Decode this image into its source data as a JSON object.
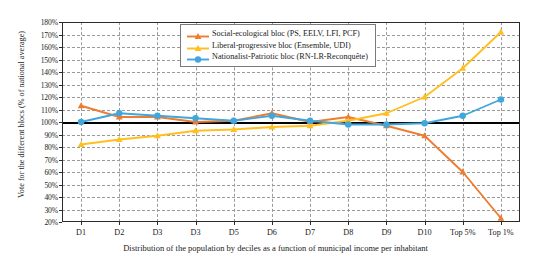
{
  "chart_data": {
    "type": "line",
    "title": "",
    "xlabel": "Distribution of the population by deciles as a function of municipal income per inhabitant",
    "ylabel": "Vote for the different blocs (% of national average)",
    "categories": [
      "D1",
      "D2",
      "D3",
      "D3",
      "D5",
      "D6",
      "D7",
      "D8",
      "D9",
      "D10",
      "Top 5%",
      "Top 1%"
    ],
    "ylim": [
      20,
      180
    ],
    "ytick_step": 10,
    "ytick_labels": [
      "180%",
      "170%",
      "160%",
      "150%",
      "140%",
      "130%",
      "120%",
      "110%",
      "100%",
      "90%",
      "80%",
      "70%",
      "60%",
      "50%",
      "40%",
      "30%",
      "20%"
    ],
    "grid": true,
    "legend_position": "top-center",
    "reference_line": 100,
    "series": [
      {
        "name": "Social-ecological bloc (PS, EELV, LFI, PCF)",
        "color": "#ED7D31",
        "marker": "triangle",
        "values": [
          113,
          104,
          104,
          100,
          101,
          107,
          100,
          104,
          97,
          89,
          60,
          23
        ]
      },
      {
        "name": "Liberal-progressive bloc (Ensemble, UDI)",
        "color": "#FFBF1F",
        "marker": "triangle",
        "values": [
          82,
          86,
          89,
          93,
          94,
          96,
          97,
          101,
          107,
          120,
          143,
          172
        ]
      },
      {
        "name": "Nationalist-Patriotic bloc (RN-LR-Reconquête)",
        "color": "#41A6DC",
        "marker": "circle",
        "values": [
          100,
          107,
          105,
          103,
          101,
          105,
          101,
          98,
          98,
          99,
          105,
          118
        ]
      }
    ]
  }
}
